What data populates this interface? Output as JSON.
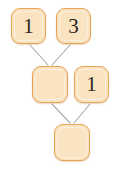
{
  "diagram": {
    "type": "node-merge-tree",
    "canvas": {
      "width": 114,
      "height": 173,
      "background": "#ffffff"
    },
    "style": {
      "node_fill": "#fae3c0",
      "node_border": "#e8a455",
      "node_highlight": "#fbf0dc",
      "label_color": "#2b2723",
      "edge_color": "#a9a9a9",
      "edge_width": 1.1,
      "corner_radius": 9
    },
    "nodes": [
      {
        "id": "n1",
        "label": "1",
        "x": 11,
        "y": 8,
        "w": 35,
        "h": 36,
        "row": "top",
        "column": "left"
      },
      {
        "id": "n2",
        "label": "3",
        "x": 56,
        "y": 8,
        "w": 35,
        "h": 36,
        "row": "top",
        "column": "right"
      },
      {
        "id": "n3",
        "label": "",
        "x": 32,
        "y": 66,
        "w": 36,
        "h": 37,
        "row": "middle",
        "column": "left"
      },
      {
        "id": "n4",
        "label": "1",
        "x": 74,
        "y": 66,
        "w": 35,
        "h": 37,
        "row": "middle",
        "column": "right"
      },
      {
        "id": "n5",
        "label": "",
        "x": 54,
        "y": 124,
        "w": 36,
        "h": 37,
        "row": "bottom",
        "column": "center"
      }
    ],
    "edges": [
      {
        "id": "e1",
        "from": "n1",
        "to": "n3",
        "x1": 30,
        "y1": 45,
        "x2": 48,
        "y2": 65
      },
      {
        "id": "e2",
        "from": "n2",
        "to": "n3",
        "x1": 70,
        "y1": 45,
        "x2": 52,
        "y2": 65
      },
      {
        "id": "e3",
        "from": "n3",
        "to": "n5",
        "x1": 52,
        "y1": 104,
        "x2": 70,
        "y2": 123
      },
      {
        "id": "e4",
        "from": "n4",
        "to": "n5",
        "x1": 90,
        "y1": 104,
        "x2": 74,
        "y2": 123
      }
    ]
  }
}
